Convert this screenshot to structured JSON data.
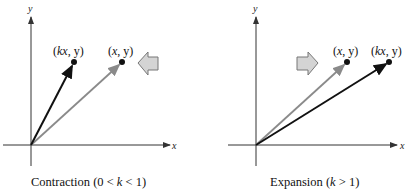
{
  "diagrams": [
    {
      "name": "contraction",
      "caption_prefix": "Contraction (0 < ",
      "caption_var": "k",
      "caption_suffix": " < 1)",
      "axis_x_label": "x",
      "axis_y_label": "y",
      "points": [
        {
          "label_prefix": "(",
          "label_var": "kx",
          "label_suffix": ", y)",
          "color": "#111111",
          "role": "image"
        },
        {
          "label_prefix": "(",
          "label_var": "x",
          "label_suffix": ", y)",
          "color": "#8a8a8a",
          "role": "original"
        }
      ],
      "arrow_direction": "left"
    },
    {
      "name": "expansion",
      "caption_prefix": "Expansion (",
      "caption_var": "k",
      "caption_suffix": " > 1)",
      "axis_x_label": "x",
      "axis_y_label": "y",
      "points": [
        {
          "label_prefix": "(",
          "label_var": "x",
          "label_suffix": ", y)",
          "color": "#8a8a8a",
          "role": "original"
        },
        {
          "label_prefix": "(",
          "label_var": "kx",
          "label_suffix": ", y)",
          "color": "#111111",
          "role": "image"
        }
      ],
      "arrow_direction": "right"
    }
  ],
  "colors": {
    "axis": "#333333",
    "vector_dark": "#111111",
    "vector_gray": "#8a8a8a",
    "block_arrow_fill": "#d4d4d4",
    "block_arrow_stroke": "#777777"
  }
}
